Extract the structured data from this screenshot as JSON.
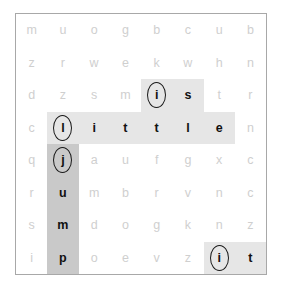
{
  "puzzle": {
    "type": "word-search",
    "rows": 8,
    "cols": 8,
    "colors": {
      "filler_letter": "#cfcfcf",
      "found_letter": "#111111",
      "highlight_light": "#e6e6e6",
      "highlight_dark": "#c9c9c9",
      "grid_border": "#a8a8a8",
      "background": "#ffffff",
      "circle_stroke": "#1a1a1a"
    },
    "found_words": [
      "is",
      "little",
      "jump",
      "it"
    ],
    "grid": [
      [
        {
          "letter": "m",
          "state": "filler",
          "highlight": "none",
          "circled": false
        },
        {
          "letter": "u",
          "state": "filler",
          "highlight": "none",
          "circled": false
        },
        {
          "letter": "o",
          "state": "filler",
          "highlight": "none",
          "circled": false
        },
        {
          "letter": "g",
          "state": "filler",
          "highlight": "none",
          "circled": false
        },
        {
          "letter": "b",
          "state": "filler",
          "highlight": "none",
          "circled": false
        },
        {
          "letter": "c",
          "state": "filler",
          "highlight": "none",
          "circled": false
        },
        {
          "letter": "u",
          "state": "filler",
          "highlight": "none",
          "circled": false
        },
        {
          "letter": "b",
          "state": "filler",
          "highlight": "none",
          "circled": false
        }
      ],
      [
        {
          "letter": "z",
          "state": "filler",
          "highlight": "none",
          "circled": false
        },
        {
          "letter": "r",
          "state": "filler",
          "highlight": "none",
          "circled": false
        },
        {
          "letter": "w",
          "state": "filler",
          "highlight": "none",
          "circled": false
        },
        {
          "letter": "e",
          "state": "filler",
          "highlight": "none",
          "circled": false
        },
        {
          "letter": "k",
          "state": "filler",
          "highlight": "none",
          "circled": false
        },
        {
          "letter": "w",
          "state": "filler",
          "highlight": "none",
          "circled": false
        },
        {
          "letter": "h",
          "state": "filler",
          "highlight": "none",
          "circled": false
        },
        {
          "letter": "n",
          "state": "filler",
          "highlight": "none",
          "circled": false
        }
      ],
      [
        {
          "letter": "d",
          "state": "filler",
          "highlight": "none",
          "circled": false
        },
        {
          "letter": "z",
          "state": "filler",
          "highlight": "none",
          "circled": false
        },
        {
          "letter": "s",
          "state": "filler",
          "highlight": "none",
          "circled": false
        },
        {
          "letter": "m",
          "state": "filler",
          "highlight": "none",
          "circled": false
        },
        {
          "letter": "i",
          "state": "found",
          "highlight": "light",
          "circled": true
        },
        {
          "letter": "s",
          "state": "found",
          "highlight": "light",
          "circled": false
        },
        {
          "letter": "t",
          "state": "filler",
          "highlight": "none",
          "circled": false
        },
        {
          "letter": "r",
          "state": "filler",
          "highlight": "none",
          "circled": false
        }
      ],
      [
        {
          "letter": "c",
          "state": "filler",
          "highlight": "none",
          "circled": false
        },
        {
          "letter": "l",
          "state": "found",
          "highlight": "light",
          "circled": true
        },
        {
          "letter": "i",
          "state": "found",
          "highlight": "light",
          "circled": false
        },
        {
          "letter": "t",
          "state": "found",
          "highlight": "light",
          "circled": false
        },
        {
          "letter": "t",
          "state": "found",
          "highlight": "light",
          "circled": false
        },
        {
          "letter": "l",
          "state": "found",
          "highlight": "light",
          "circled": false
        },
        {
          "letter": "e",
          "state": "found",
          "highlight": "light",
          "circled": false
        },
        {
          "letter": "n",
          "state": "filler",
          "highlight": "none",
          "circled": false
        }
      ],
      [
        {
          "letter": "q",
          "state": "filler",
          "highlight": "none",
          "circled": false
        },
        {
          "letter": "j",
          "state": "found",
          "highlight": "dark",
          "circled": true
        },
        {
          "letter": "a",
          "state": "filler",
          "highlight": "none",
          "circled": false
        },
        {
          "letter": "u",
          "state": "filler",
          "highlight": "none",
          "circled": false
        },
        {
          "letter": "f",
          "state": "filler",
          "highlight": "none",
          "circled": false
        },
        {
          "letter": "g",
          "state": "filler",
          "highlight": "none",
          "circled": false
        },
        {
          "letter": "x",
          "state": "filler",
          "highlight": "none",
          "circled": false
        },
        {
          "letter": "c",
          "state": "filler",
          "highlight": "none",
          "circled": false
        }
      ],
      [
        {
          "letter": "r",
          "state": "filler",
          "highlight": "none",
          "circled": false
        },
        {
          "letter": "u",
          "state": "found",
          "highlight": "dark",
          "circled": false
        },
        {
          "letter": "m",
          "state": "filler",
          "highlight": "none",
          "circled": false
        },
        {
          "letter": "b",
          "state": "filler",
          "highlight": "none",
          "circled": false
        },
        {
          "letter": "r",
          "state": "filler",
          "highlight": "none",
          "circled": false
        },
        {
          "letter": "v",
          "state": "filler",
          "highlight": "none",
          "circled": false
        },
        {
          "letter": "n",
          "state": "filler",
          "highlight": "none",
          "circled": false
        },
        {
          "letter": "c",
          "state": "filler",
          "highlight": "none",
          "circled": false
        }
      ],
      [
        {
          "letter": "s",
          "state": "filler",
          "highlight": "none",
          "circled": false
        },
        {
          "letter": "m",
          "state": "found",
          "highlight": "dark",
          "circled": false
        },
        {
          "letter": "d",
          "state": "filler",
          "highlight": "none",
          "circled": false
        },
        {
          "letter": "o",
          "state": "filler",
          "highlight": "none",
          "circled": false
        },
        {
          "letter": "g",
          "state": "filler",
          "highlight": "none",
          "circled": false
        },
        {
          "letter": "k",
          "state": "filler",
          "highlight": "none",
          "circled": false
        },
        {
          "letter": "n",
          "state": "filler",
          "highlight": "none",
          "circled": false
        },
        {
          "letter": "z",
          "state": "filler",
          "highlight": "none",
          "circled": false
        }
      ],
      [
        {
          "letter": "i",
          "state": "filler",
          "highlight": "none",
          "circled": false
        },
        {
          "letter": "p",
          "state": "found",
          "highlight": "dark",
          "circled": false
        },
        {
          "letter": "o",
          "state": "filler",
          "highlight": "none",
          "circled": false
        },
        {
          "letter": "e",
          "state": "filler",
          "highlight": "none",
          "circled": false
        },
        {
          "letter": "v",
          "state": "filler",
          "highlight": "none",
          "circled": false
        },
        {
          "letter": "z",
          "state": "filler",
          "highlight": "none",
          "circled": false
        },
        {
          "letter": "i",
          "state": "found",
          "highlight": "light",
          "circled": true
        },
        {
          "letter": "t",
          "state": "found",
          "highlight": "light",
          "circled": false
        }
      ]
    ]
  }
}
